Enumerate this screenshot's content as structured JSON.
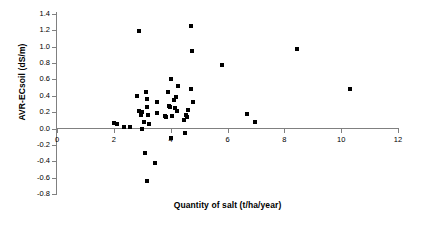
{
  "chart_data": {
    "type": "scatter",
    "title": "",
    "xlabel": "Quantity of salt (t/ha/year)",
    "ylabel": "AVR-ECsoil (dS/m)",
    "xlim": [
      0,
      12
    ],
    "ylim": [
      -0.8,
      1.4
    ],
    "xticks": [
      0,
      2,
      4,
      6,
      8,
      10,
      12
    ],
    "xtick_labels": [
      "0",
      "2",
      "4",
      "6",
      "8",
      "10",
      "12"
    ],
    "yticks": [
      -0.8,
      -0.6,
      -0.4,
      -0.2,
      0.0,
      0.2,
      0.4,
      0.6,
      0.8,
      1.0,
      1.2,
      1.4
    ],
    "ytick_labels": [
      "-0.8",
      "-0.6",
      "-0.4",
      "-0.2",
      "0.0",
      "0.2",
      "0.4",
      "0.6",
      "0.8",
      "1.0",
      "1.2",
      "1.4"
    ],
    "grid": false,
    "legend": null,
    "marker": "square",
    "marker_color": "#000000",
    "zero_line": true,
    "series": [
      {
        "name": "AVR-ECsoil vs salt load",
        "points": [
          [
            2.0,
            0.07
          ],
          [
            2.1,
            0.06
          ],
          [
            2.35,
            0.02
          ],
          [
            2.55,
            0.02
          ],
          [
            2.8,
            0.4
          ],
          [
            2.9,
            1.19
          ],
          [
            2.9,
            0.22
          ],
          [
            2.95,
            0.19
          ],
          [
            2.95,
            0.17
          ],
          [
            3.0,
            0.2
          ],
          [
            3.0,
            0.0
          ],
          [
            3.05,
            0.08
          ],
          [
            3.1,
            -0.3
          ],
          [
            3.12,
            0.45
          ],
          [
            3.15,
            -0.64
          ],
          [
            3.15,
            0.36
          ],
          [
            3.18,
            0.26
          ],
          [
            3.2,
            0.17
          ],
          [
            3.22,
            0.05
          ],
          [
            3.45,
            -0.42
          ],
          [
            3.5,
            0.32
          ],
          [
            3.52,
            0.19
          ],
          [
            3.8,
            0.15
          ],
          [
            3.85,
            0.14
          ],
          [
            3.9,
            0.44
          ],
          [
            3.95,
            0.28
          ],
          [
            3.98,
            0.26
          ],
          [
            4.0,
            0.6
          ],
          [
            4.02,
            0.61
          ],
          [
            4.0,
            -0.12
          ],
          [
            4.05,
            0.15
          ],
          [
            4.1,
            0.35
          ],
          [
            4.15,
            0.25
          ],
          [
            4.2,
            0.39
          ],
          [
            4.22,
            0.21
          ],
          [
            4.25,
            0.52
          ],
          [
            4.45,
            0.1
          ],
          [
            4.5,
            -0.05
          ],
          [
            4.55,
            0.16
          ],
          [
            4.58,
            0.14
          ],
          [
            4.62,
            0.23
          ],
          [
            4.7,
            1.25
          ],
          [
            4.72,
            0.48
          ],
          [
            4.75,
            0.95
          ],
          [
            4.8,
            0.32
          ],
          [
            5.8,
            0.78
          ],
          [
            6.7,
            0.18
          ],
          [
            6.95,
            0.08
          ],
          [
            8.45,
            0.97
          ],
          [
            10.3,
            0.48
          ]
        ]
      }
    ]
  }
}
